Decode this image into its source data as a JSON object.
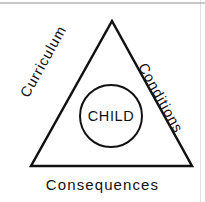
{
  "figure": {
    "shape_type": "triangle-with-inscribed-circle",
    "stroke_color": "#111111",
    "background_color": "#ffffff"
  },
  "triangle": {
    "name": "outer-triangle",
    "apex_label": "",
    "vertices": {
      "apex": [
        112,
        21
      ],
      "bottom_left": [
        31,
        166
      ],
      "bottom_right": [
        192,
        166
      ]
    },
    "stroke_width": 2.5
  },
  "circle": {
    "name": "center-circle",
    "center": [
      111,
      116
    ],
    "radius": 31,
    "stroke_width": 2,
    "label": "CHILD"
  },
  "labels": {
    "left_edge": "Curriculum",
    "right_edge": "Conditions",
    "bottom_edge": "Consequences",
    "center": "CHILD"
  },
  "artifacts": {
    "top_scan_line": "horizontal-gray-scan-line",
    "right_scan_line": "vertical-gray-scan-line"
  }
}
